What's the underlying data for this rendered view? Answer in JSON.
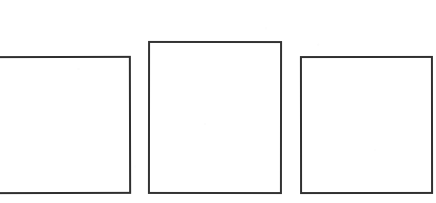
{
  "canvas": {
    "width": 436,
    "height": 203,
    "background_color": "#ffffff",
    "description": "Three empty outlined rectangles in a row on a white background"
  },
  "style": {
    "stroke_color": "#333333",
    "stroke_width_px": 2,
    "fill_color": "#ffffff"
  },
  "shapes": [
    {
      "id": "rect-left",
      "label": "Left rectangle",
      "shape": "rectangle",
      "fill": "#ffffff",
      "stroke": "#2f2f2f",
      "stroke_width": 2,
      "x": -10,
      "y": 56,
      "width": 141,
      "height": 138,
      "clipped_edge": "left",
      "content": ""
    },
    {
      "id": "rect-center",
      "label": "Center rectangle",
      "shape": "rectangle",
      "fill": "#ffffff",
      "stroke": "#333333",
      "stroke_width": 2,
      "x": 148,
      "y": 41,
      "width": 134,
      "height": 153,
      "clipped_edge": "none",
      "content": ""
    },
    {
      "id": "rect-right",
      "label": "Right rectangle",
      "shape": "rectangle",
      "fill": "#ffffff",
      "stroke": "#303030",
      "stroke_width": 2,
      "x": 300,
      "y": 56,
      "width": 133,
      "height": 138,
      "clipped_edge": "none",
      "content": ""
    }
  ],
  "layout": {
    "shared_baseline_y": 194,
    "gap_left_to_center_px": 18,
    "gap_center_to_right_px": 18,
    "center_rises_above_outer_px": 15
  }
}
